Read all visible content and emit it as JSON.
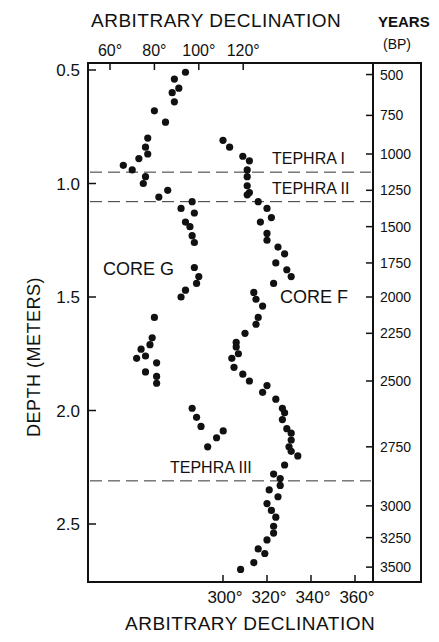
{
  "chart_data": {
    "type": "scatter",
    "title": "",
    "top_xlabel": "ARBITRARY DECLINATION",
    "bottom_xlabel": "ARBITRARY DECLINATION",
    "ylabel": "DEPTH (METERS)",
    "right_label": "YEARS",
    "right_sublabel": "(BP)",
    "top_ticks": [
      "60°",
      "80°",
      "100°",
      "120°"
    ],
    "top_tick_values": [
      60,
      80,
      100,
      120
    ],
    "bottom_ticks": [
      "300°",
      "320°",
      "340°",
      "360°"
    ],
    "bottom_tick_values": [
      300,
      320,
      340,
      360
    ],
    "y_ticks": [
      "0.5",
      "1.0",
      "1.5",
      "2.0",
      "2.5"
    ],
    "y_tick_values": [
      0.5,
      1.0,
      1.5,
      2.0,
      2.5
    ],
    "ylim": [
      0.48,
      2.73
    ],
    "grid": false,
    "years_scale": [
      {
        "label": "500",
        "depth": 0.52
      },
      {
        "label": "750",
        "depth": 0.7
      },
      {
        "label": "1000",
        "depth": 0.87
      },
      {
        "label": "1250",
        "depth": 1.03
      },
      {
        "label": "1500",
        "depth": 1.19
      },
      {
        "label": "1750",
        "depth": 1.35
      },
      {
        "label": "2000",
        "depth": 1.5
      },
      {
        "label": "2250",
        "depth": 1.66
      },
      {
        "label": "2500",
        "depth": 1.87
      },
      {
        "label": "2750",
        "depth": 2.16
      },
      {
        "label": "3000",
        "depth": 2.42
      },
      {
        "label": "3250",
        "depth": 2.56
      },
      {
        "label": "3500",
        "depth": 2.69
      }
    ],
    "tephra_layers": [
      {
        "label": "TEPHRA I",
        "depth": 0.95
      },
      {
        "label": "TEPHRA II",
        "depth": 1.08
      },
      {
        "label": "TEPHRA III",
        "depth": 2.31
      }
    ],
    "annotations": [
      {
        "text": "CORE G"
      },
      {
        "text": "CORE F"
      }
    ],
    "series": [
      {
        "name": "CORE G",
        "axis": "top",
        "points": [
          [
            94,
            0.51
          ],
          [
            89,
            0.54
          ],
          [
            91,
            0.58
          ],
          [
            88,
            0.6
          ],
          [
            89,
            0.64
          ],
          [
            80,
            0.68
          ],
          [
            85,
            0.73
          ],
          [
            77,
            0.8
          ],
          [
            76,
            0.84
          ],
          [
            77,
            0.87
          ],
          [
            73,
            0.89
          ],
          [
            70,
            0.94
          ],
          [
            66,
            0.92
          ],
          [
            76,
            0.97
          ],
          [
            75,
            1.0
          ],
          [
            86,
            1.03
          ],
          [
            82,
            1.06
          ],
          [
            97,
            1.08
          ],
          [
            92,
            1.11
          ],
          [
            98,
            1.13
          ],
          [
            94,
            1.17
          ],
          [
            96,
            1.19
          ],
          [
            97,
            1.23
          ],
          [
            98,
            1.26
          ],
          [
            98,
            1.37
          ],
          [
            100,
            1.41
          ],
          [
            99,
            1.44
          ],
          [
            94,
            1.47
          ],
          [
            92,
            1.5
          ],
          [
            80,
            1.59
          ],
          [
            79,
            1.68
          ],
          [
            78,
            1.71
          ],
          [
            74,
            1.73
          ],
          [
            76,
            1.76
          ],
          [
            72,
            1.77
          ],
          [
            81,
            1.79
          ],
          [
            76,
            1.83
          ],
          [
            81,
            1.85
          ],
          [
            81,
            1.88
          ],
          [
            97,
            1.99
          ],
          [
            99,
            2.03
          ],
          [
            101,
            2.07
          ],
          [
            111,
            2.09
          ],
          [
            108,
            2.12
          ],
          [
            104,
            2.16
          ]
        ]
      },
      {
        "name": "CORE F",
        "axis": "bottom",
        "points": [
          [
            300,
            0.81
          ],
          [
            303,
            0.84
          ],
          [
            309,
            0.88
          ],
          [
            312,
            0.9
          ],
          [
            311,
            0.94
          ],
          [
            311,
            0.97
          ],
          [
            311,
            1.01
          ],
          [
            312,
            1.04
          ],
          [
            311,
            1.05
          ],
          [
            316,
            1.08
          ],
          [
            320,
            1.11
          ],
          [
            322,
            1.15
          ],
          [
            317,
            1.17
          ],
          [
            320,
            1.22
          ],
          [
            320,
            1.25
          ],
          [
            325,
            1.28
          ],
          [
            328,
            1.31
          ],
          [
            324,
            1.35
          ],
          [
            329,
            1.38
          ],
          [
            331,
            1.41
          ],
          [
            323,
            1.44
          ],
          [
            314,
            1.48
          ],
          [
            315,
            1.51
          ],
          [
            318,
            1.54
          ],
          [
            316,
            1.59
          ],
          [
            315,
            1.62
          ],
          [
            310,
            1.66
          ],
          [
            306,
            1.7
          ],
          [
            306,
            1.72
          ],
          [
            307,
            1.75
          ],
          [
            304,
            1.77
          ],
          [
            305,
            1.81
          ],
          [
            309,
            1.84
          ],
          [
            312,
            1.87
          ],
          [
            320,
            1.89
          ],
          [
            318,
            1.92
          ],
          [
            324,
            1.95
          ],
          [
            327,
            1.99
          ],
          [
            328,
            2.01
          ],
          [
            327,
            2.04
          ],
          [
            329,
            2.08
          ],
          [
            331,
            2.1
          ],
          [
            331,
            2.13
          ],
          [
            330,
            2.16
          ],
          [
            331,
            2.18
          ],
          [
            334,
            2.2
          ],
          [
            328,
            2.24
          ],
          [
            323,
            2.28
          ],
          [
            326,
            2.3
          ],
          [
            326,
            2.33
          ],
          [
            321,
            2.35
          ],
          [
            325,
            2.38
          ],
          [
            320,
            2.41
          ],
          [
            322,
            2.44
          ],
          [
            324,
            2.47
          ],
          [
            323,
            2.51
          ],
          [
            323,
            2.54
          ],
          [
            320,
            2.57
          ],
          [
            316,
            2.61
          ],
          [
            319,
            2.63
          ],
          [
            314,
            2.67
          ],
          [
            308,
            2.7
          ]
        ]
      }
    ]
  }
}
